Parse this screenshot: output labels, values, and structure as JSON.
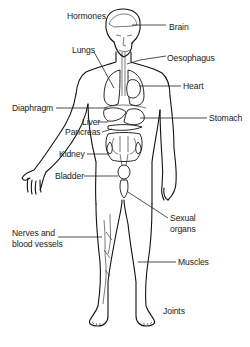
{
  "diagram": {
    "type": "anatomy-labeled-figure",
    "labels": [
      {
        "id": "hormones",
        "text": "Hormones",
        "x": 67,
        "y": 11
      },
      {
        "id": "brain",
        "text": "Brain",
        "x": 169,
        "y": 22
      },
      {
        "id": "lungs",
        "text": "Lungs",
        "x": 72,
        "y": 45
      },
      {
        "id": "oesophagus",
        "text": "Oesophagus",
        "x": 167,
        "y": 53
      },
      {
        "id": "heart",
        "text": "Heart",
        "x": 183,
        "y": 81
      },
      {
        "id": "diaphragm",
        "text": "Diaphragm",
        "x": 12,
        "y": 105
      },
      {
        "id": "stomach",
        "text": "Stomach",
        "x": 209,
        "y": 115
      },
      {
        "id": "liver",
        "text": "Liver",
        "x": 82,
        "y": 119
      },
      {
        "id": "pancreas",
        "text": "Pancreas",
        "x": 65,
        "y": 129
      },
      {
        "id": "kidney",
        "text": "Kidney",
        "x": 59,
        "y": 151
      },
      {
        "id": "bladder",
        "text": "Bladder",
        "x": 55,
        "y": 173
      },
      {
        "id": "sexual_organs_1",
        "text": "Sexual",
        "x": 170,
        "y": 215
      },
      {
        "id": "sexual_organs_2",
        "text": "organs",
        "x": 170,
        "y": 227
      },
      {
        "id": "nerves_1",
        "text": "Nerves and",
        "x": 12,
        "y": 230
      },
      {
        "id": "nerves_2",
        "text": "blood vessels",
        "x": 12,
        "y": 241
      },
      {
        "id": "muscles",
        "text": "Muscles",
        "x": 178,
        "y": 260
      },
      {
        "id": "joints",
        "text": "Joints",
        "x": 163,
        "y": 309
      }
    ]
  }
}
